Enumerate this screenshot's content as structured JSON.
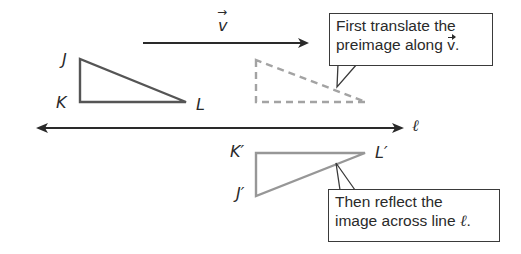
{
  "diagram": {
    "colors": {
      "preimage": "#4a4a4a",
      "translated": "#a0a0a0",
      "final_image": "#909090",
      "lines": "#2a2a2a"
    },
    "vector": {
      "label": "v",
      "arrow_symbol": "→"
    },
    "line_l": {
      "label": "ℓ"
    },
    "preimage": {
      "vertices": [
        {
          "name": "J",
          "label": "J"
        },
        {
          "name": "K",
          "label": "K"
        },
        {
          "name": "L",
          "label": "L"
        }
      ]
    },
    "translated_image": {
      "style": "dashed"
    },
    "final_image": {
      "vertices": [
        {
          "name": "J'",
          "label": "J′"
        },
        {
          "name": "K'",
          "label": "K′"
        },
        {
          "name": "L'",
          "label": "L′"
        }
      ]
    },
    "callouts": [
      {
        "line1": "First translate the",
        "line2_prefix": "preimage along ",
        "line2_vec": "v",
        "line2_suffix": "."
      },
      {
        "line1": "Then reflect the",
        "line2_prefix": "image across line ",
        "line2_sym": "ℓ",
        "line2_suffix": "."
      }
    ]
  }
}
